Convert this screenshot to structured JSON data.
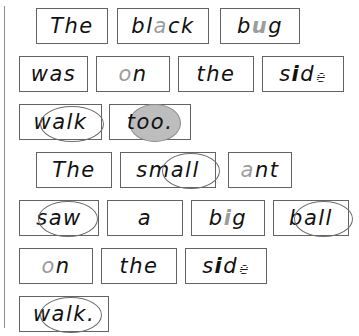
{
  "page": {
    "background_color": "#ffffff",
    "margin_rule_color": "#8f8f8f",
    "box_border_color": "#636363",
    "text_color": "#111111",
    "gray_letter_color": "#9d9d9d",
    "ellipse_stroke_color": "#6d6d6d",
    "ellipse_fill_color": "#bdbdbd"
  },
  "sentences": [
    {
      "id": "sentence-1",
      "text": "The black bug",
      "words": [
        "The",
        "black",
        "bug"
      ]
    },
    {
      "id": "sentence-2",
      "text": "was on the side walk too.",
      "words": [
        "was",
        "on",
        "the",
        "side",
        "walk",
        "too."
      ]
    },
    {
      "id": "sentence-3",
      "text": "The small ant saw a big ball on the side walk.",
      "words": [
        "The",
        "small",
        "ant",
        "saw",
        "a",
        "big",
        "ball",
        "on",
        "the",
        "side",
        "walk."
      ]
    }
  ],
  "rows": [
    {
      "id": "row-1",
      "cards": [
        {
          "id": "card-the-1",
          "word": "The",
          "plain": "The",
          "mark": "none"
        },
        {
          "id": "card-black",
          "word": "black",
          "plain": "black",
          "mark": "gray-letter",
          "marked_letters": "a"
        },
        {
          "id": "card-bug",
          "word": "bug",
          "plain": "bug",
          "mark": "gray-letter",
          "marked_letters": "u"
        }
      ]
    },
    {
      "id": "row-2",
      "cards": [
        {
          "id": "card-was",
          "word": "was",
          "plain": "was",
          "mark": "underline"
        },
        {
          "id": "card-on-1",
          "word": "on",
          "plain": "on",
          "mark": "gray-letter",
          "marked_letters": "o"
        },
        {
          "id": "card-the-2",
          "word": "the",
          "plain": "the",
          "mark": "none"
        },
        {
          "id": "card-side-1",
          "word": "side",
          "plain": "side",
          "mark": "bold-and-hatched",
          "marked_letters": "i,e"
        }
      ]
    },
    {
      "id": "row-3",
      "cards": [
        {
          "id": "card-walk-1",
          "word": "walk",
          "plain": "walk",
          "mark": "ellipse",
          "marked_letters": "alk"
        },
        {
          "id": "card-too",
          "word": "too.",
          "plain": "too.",
          "mark": "filled-ellipse",
          "marked_letters": "oo"
        }
      ]
    },
    {
      "id": "row-4",
      "cards": [
        {
          "id": "card-the-3",
          "word": "The",
          "plain": "The",
          "mark": "none"
        },
        {
          "id": "card-small",
          "word": "small",
          "plain": "small",
          "mark": "ellipse",
          "marked_letters": "all"
        },
        {
          "id": "card-ant",
          "word": "ant",
          "plain": "ant",
          "mark": "gray-letter",
          "marked_letters": "a"
        }
      ]
    },
    {
      "id": "row-5",
      "cards": [
        {
          "id": "card-saw",
          "word": "saw",
          "plain": "saw",
          "mark": "ellipse",
          "marked_letters": "aw"
        },
        {
          "id": "card-a",
          "word": "a",
          "plain": "a",
          "mark": "bold"
        },
        {
          "id": "card-big",
          "word": "big",
          "plain": "big",
          "mark": "gray-bold-letter",
          "marked_letters": "i"
        },
        {
          "id": "card-ball",
          "word": "ball",
          "plain": "ball",
          "mark": "ellipse",
          "marked_letters": "all"
        }
      ]
    },
    {
      "id": "row-6",
      "cards": [
        {
          "id": "card-on-2",
          "word": "on",
          "plain": "on",
          "mark": "gray-letter",
          "marked_letters": "o"
        },
        {
          "id": "card-the-4",
          "word": "the",
          "plain": "the",
          "mark": "none"
        },
        {
          "id": "card-side-2",
          "word": "side",
          "plain": "side",
          "mark": "bold-and-hatched",
          "marked_letters": "i,e"
        }
      ]
    },
    {
      "id": "row-7",
      "cards": [
        {
          "id": "card-walk-2",
          "word": "walk.",
          "plain": "walk.",
          "mark": "ellipse",
          "marked_letters": "alk"
        }
      ]
    }
  ],
  "word_parts": {
    "the_1": {
      "a": "The"
    },
    "black": {
      "a": "bl",
      "b": "a",
      "c": "ck"
    },
    "bug": {
      "a": "b",
      "b": "u",
      "c": "g"
    },
    "was": {
      "a": "was"
    },
    "on_1": {
      "a": "o",
      "b": "n"
    },
    "the_2": {
      "a": "the"
    },
    "side_1": {
      "a": "s",
      "b": "i",
      "c": "d",
      "d": "e"
    },
    "walk_1": {
      "a": "w",
      "b": "alk"
    },
    "too": {
      "a": "t",
      "b": "oo",
      "c": "."
    },
    "the_3": {
      "a": "The"
    },
    "small": {
      "a": "sm",
      "b": "all"
    },
    "ant": {
      "a": "a",
      "b": "nt"
    },
    "saw": {
      "a": "s",
      "b": "aw"
    },
    "a": {
      "a": "a"
    },
    "big": {
      "a": "b",
      "b": "i",
      "c": "g"
    },
    "ball": {
      "a": "b",
      "b": "all"
    },
    "on_2": {
      "a": "o",
      "b": "n"
    },
    "the_4": {
      "a": "the"
    },
    "side_2": {
      "a": "s",
      "b": "i",
      "c": "d",
      "d": "e"
    },
    "walk_2": {
      "a": "w",
      "b": "alk",
      "c": "."
    }
  }
}
